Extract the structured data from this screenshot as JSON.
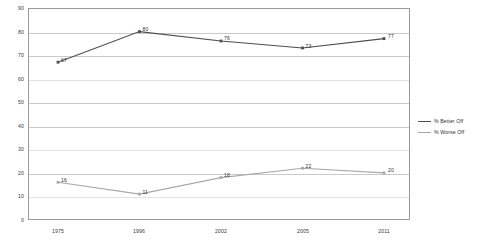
{
  "chart_data": {
    "type": "line",
    "title": "",
    "subtitle": "",
    "xlabel": "",
    "ylabel": "",
    "categories": [
      "1975",
      "1996",
      "2002",
      "2005",
      "2011"
    ],
    "ylim": [
      0,
      90
    ],
    "yticks": [
      "0",
      "10",
      "20",
      "30",
      "40",
      "50",
      "60",
      "70",
      "80",
      "90"
    ],
    "grid": true,
    "legend_position": "right",
    "series": [
      {
        "name": "% Better Off",
        "color": "#4d4d4d",
        "values": [
          67,
          80,
          76,
          73,
          77
        ],
        "labels": [
          "67",
          "80",
          "76",
          "73",
          "77"
        ]
      },
      {
        "name": "% Worse Off",
        "color": "#a8a8a8",
        "values": [
          16,
          11,
          18,
          22,
          20
        ],
        "labels": [
          "16",
          "11",
          "18",
          "22",
          "20"
        ]
      }
    ]
  },
  "axis": {
    "y_ticks": [
      "90",
      "80",
      "70",
      "60",
      "50",
      "40",
      "30",
      "20",
      "10",
      "0"
    ],
    "x_ticks": [
      "1975",
      "1996",
      "2002",
      "2005",
      "2011"
    ]
  },
  "legend": {
    "items": [
      {
        "label": "% Better Off",
        "color": "#4d4d4d"
      },
      {
        "label": "% Worse Off",
        "color": "#a8a8a8"
      }
    ]
  }
}
